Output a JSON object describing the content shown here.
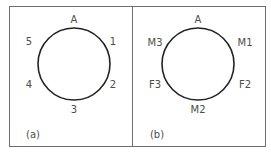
{
  "panels": [
    {
      "id": "a",
      "caption": "(a)",
      "circle": {
        "cx": 74,
        "cy": 64,
        "r": 36
      },
      "labels": [
        {
          "text": "A",
          "x": 74,
          "y": 20
        },
        {
          "text": "1",
          "x": 113,
          "y": 42
        },
        {
          "text": "2",
          "x": 113,
          "y": 85
        },
        {
          "text": "3",
          "x": 74,
          "y": 110
        },
        {
          "text": "4",
          "x": 29,
          "y": 85
        },
        {
          "text": "5",
          "x": 29,
          "y": 42
        }
      ]
    },
    {
      "id": "b",
      "caption": "(b)",
      "circle": {
        "cx": 198,
        "cy": 64,
        "r": 36
      },
      "labels": [
        {
          "text": "A",
          "x": 198,
          "y": 20
        },
        {
          "text": "M1",
          "x": 245,
          "y": 43
        },
        {
          "text": "F2",
          "x": 245,
          "y": 85
        },
        {
          "text": "M2",
          "x": 198,
          "y": 110
        },
        {
          "text": "F3",
          "x": 155,
          "y": 85
        },
        {
          "text": "M3",
          "x": 155,
          "y": 43
        }
      ]
    }
  ],
  "colors": {
    "stroke": "#222222",
    "border": "#6e6e6e",
    "text": "#4d4d4d"
  }
}
